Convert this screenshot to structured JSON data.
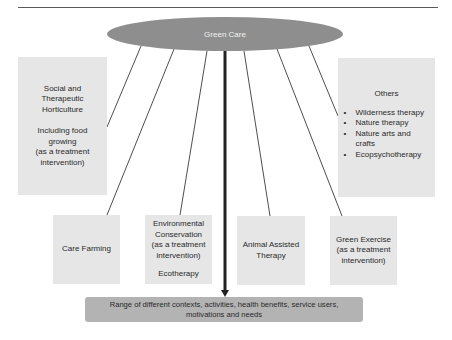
{
  "diagram": {
    "center": {
      "label": "Green Care",
      "color": "#8e8e8e"
    },
    "boxes": {
      "social": {
        "title_lines": [
          "Social and",
          "Therapeutic",
          "Horticulture"
        ],
        "sub_lines": [
          "Including food",
          "growing",
          "(as a treatment",
          "intervention)"
        ]
      },
      "others": {
        "title": "Others",
        "bullet": "•",
        "items": [
          "Wilderness therapy",
          "Nature therapy",
          "Nature arts and crafts",
          "Ecopsychotherapy"
        ]
      },
      "care_farming": {
        "lines": [
          "Care Farming"
        ]
      },
      "environmental": {
        "lines": [
          "Environmental",
          "Conservation",
          "(as a treatment",
          "intervention)"
        ],
        "sub": "Ecotherapy"
      },
      "animal": {
        "lines": [
          "Animal Assisted",
          "Therapy"
        ]
      },
      "exercise": {
        "lines": [
          "Green Exercise",
          "(as a treatment",
          "intervention)"
        ]
      }
    },
    "outcome": {
      "lines": [
        "Range of different contexts, activities, health benefits, service users,",
        "motivations and needs"
      ]
    },
    "colors": {
      "box_fill": "#e6e6e6",
      "outcome_fill": "#b3b3b3",
      "line": "#3a3a3a",
      "arrow": "#222222"
    }
  }
}
